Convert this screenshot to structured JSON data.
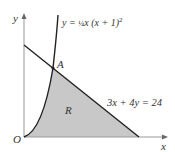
{
  "diagram": {
    "axis_labels": {
      "x": "x",
      "y": "y",
      "origin": "O"
    },
    "curve_label": {
      "prefix": "y = ",
      "frac": "¼",
      "body": "x (x + 1)",
      "exp": "2"
    },
    "line_label": "3x + 4y = 24",
    "point_label": "A",
    "region_label": "R",
    "colors": {
      "axis": "#888888",
      "curve": "#222222",
      "region": "#c8c8c8"
    }
  }
}
